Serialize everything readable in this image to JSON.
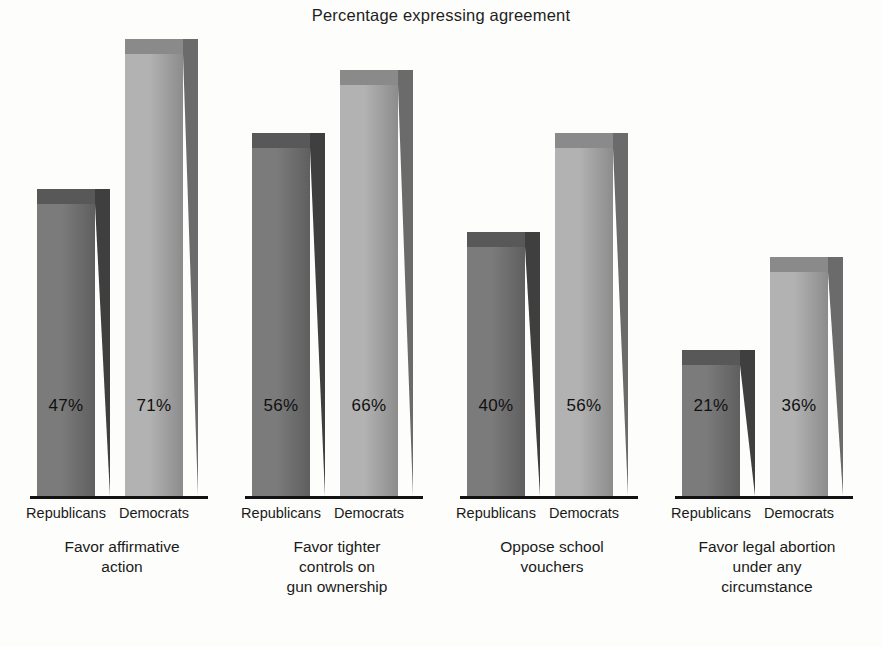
{
  "chart_data": {
    "type": "bar",
    "title": "Percentage expressing agreement",
    "xlabel": "",
    "ylabel": "",
    "ylim": [
      0,
      75
    ],
    "grid": false,
    "legend_position": "none",
    "value_suffix": "%",
    "categories": [
      "Favor affirmative action",
      "Favor tighter controls on gun ownership",
      "Oppose school vouchers",
      "Favor legal abortion under any circumstance"
    ],
    "category_lines": [
      [
        "Favor affirmative",
        "action"
      ],
      [
        "Favor tighter",
        "controls on",
        "gun ownership"
      ],
      [
        "Oppose school",
        "vouchers"
      ],
      [
        "Favor legal abortion",
        "under any",
        "circumstance"
      ]
    ],
    "series": [
      {
        "name": "Republicans",
        "values": [
          47,
          56,
          40,
          21
        ],
        "color": "#6d6d6d"
      },
      {
        "name": "Democrats",
        "values": [
          71,
          66,
          56,
          36
        ],
        "color": "#9c9c9c"
      }
    ],
    "value_labels": [
      [
        "47%",
        "71%"
      ],
      [
        "56%",
        "66%"
      ],
      [
        "40%",
        "56%"
      ],
      [
        "21%",
        "36%"
      ]
    ]
  },
  "colors": {
    "background": "#fdfdfb",
    "axis": "#121212",
    "text": "#1a1a1a",
    "republican_front_light": "#7b7b7b",
    "republican_front_dark": "#5f5f5f",
    "republican_side": "#3f3f3f",
    "republican_top": "#585858",
    "democrat_front_light": "#b2b2b2",
    "democrat_front_dark": "#8c8c8c",
    "democrat_side": "#6b6b6b",
    "democrat_top": "#8a8a8a"
  }
}
